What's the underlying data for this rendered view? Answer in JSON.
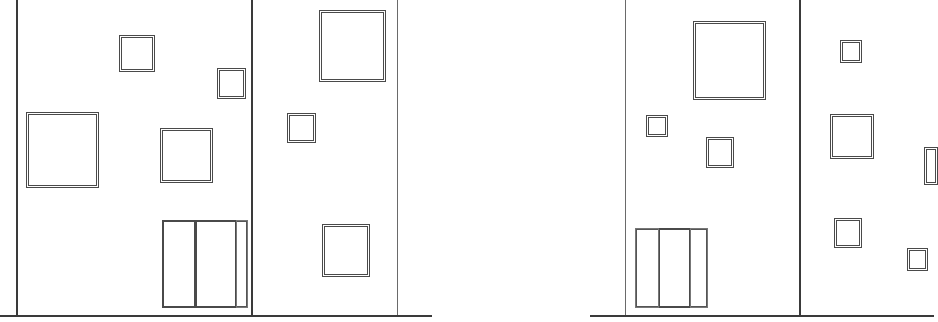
{
  "drawing": {
    "type": "architectural-elevation",
    "line_color": "#3a3a3a",
    "background": "#ffffff",
    "ground_lines": [
      {
        "name": "left-ground",
        "x1": 0,
        "x2": 432,
        "y": 315
      },
      {
        "name": "right-ground",
        "x1": 590,
        "x2": 934,
        "y": 315
      }
    ],
    "buildings": [
      {
        "name": "left-elevation",
        "walls": [
          {
            "name": "left-wall",
            "x": 16,
            "y1": 0,
            "y2": 315,
            "weight": "heavy"
          },
          {
            "name": "center-wall",
            "x": 251,
            "y1": 0,
            "y2": 315,
            "weight": "heavy"
          },
          {
            "name": "right-wall",
            "x": 397,
            "y1": 0,
            "y2": 315,
            "weight": "thin"
          }
        ],
        "windows": [
          {
            "x": 119,
            "y": 35,
            "w": 36,
            "h": 37
          },
          {
            "x": 217,
            "y": 68,
            "w": 29,
            "h": 31
          },
          {
            "x": 26,
            "y": 112,
            "w": 73,
            "h": 76
          },
          {
            "x": 160,
            "y": 128,
            "w": 53,
            "h": 55
          },
          {
            "x": 319,
            "y": 10,
            "w": 67,
            "h": 72
          },
          {
            "x": 287,
            "y": 113,
            "w": 29,
            "h": 30
          },
          {
            "x": 322,
            "y": 224,
            "w": 48,
            "h": 53
          }
        ],
        "door": {
          "x": 162,
          "y": 220,
          "w": 86,
          "h": 88,
          "panels": [
            {
              "x": 162,
              "y": 220,
              "w": 34,
              "h": 88
            },
            {
              "x": 195,
              "y": 220,
              "w": 42,
              "h": 88
            }
          ],
          "sidelight": {
            "x": 236,
            "y": 220,
            "w": 12,
            "h": 88
          }
        }
      },
      {
        "name": "right-elevation",
        "walls": [
          {
            "name": "left-wall",
            "x": 625,
            "y1": 0,
            "y2": 315,
            "weight": "thin"
          },
          {
            "name": "center-wall",
            "x": 799,
            "y1": 0,
            "y2": 315,
            "weight": "heavy"
          }
        ],
        "windows": [
          {
            "x": 693,
            "y": 21,
            "w": 73,
            "h": 79
          },
          {
            "x": 646,
            "y": 115,
            "w": 22,
            "h": 22
          },
          {
            "x": 706,
            "y": 137,
            "w": 28,
            "h": 31
          },
          {
            "x": 840,
            "y": 40,
            "w": 22,
            "h": 23
          },
          {
            "x": 830,
            "y": 114,
            "w": 44,
            "h": 45
          },
          {
            "x": 834,
            "y": 218,
            "w": 28,
            "h": 30
          },
          {
            "x": 907,
            "y": 248,
            "w": 21,
            "h": 23
          },
          {
            "x": 924,
            "y": 147,
            "w": 14,
            "h": 38
          }
        ],
        "door": {
          "x": 635,
          "y": 228,
          "w": 73,
          "h": 80,
          "panels": [
            {
              "x": 658,
              "y": 228,
              "w": 33,
              "h": 80
            }
          ],
          "sidelights": [
            {
              "x": 635,
              "y": 228,
              "w": 24,
              "h": 80
            },
            {
              "x": 690,
              "y": 228,
              "w": 18,
              "h": 80
            }
          ]
        }
      }
    ]
  }
}
